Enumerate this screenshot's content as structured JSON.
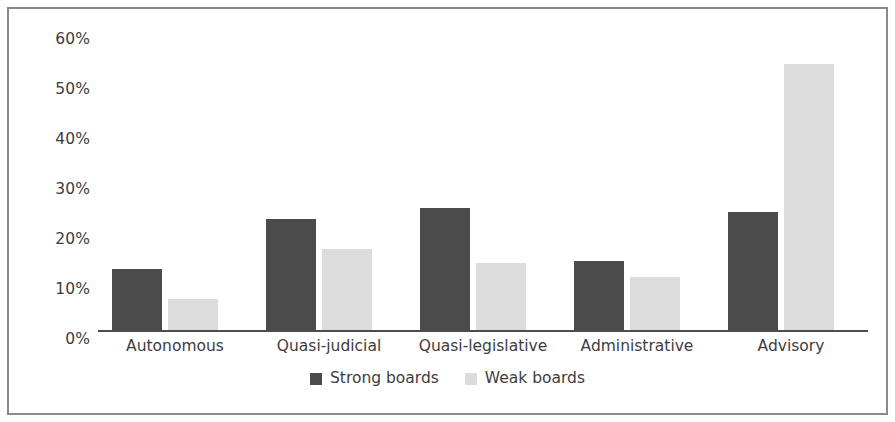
{
  "chart_data": {
    "type": "bar",
    "title": "",
    "subtitle": "",
    "xlabel": "",
    "ylabel": "",
    "categories": [
      "Autonomous",
      "Quasi-judicial",
      "Quasi-legislative",
      "Administrative",
      "Advisory"
    ],
    "series": [
      {
        "name": "Strong boards",
        "color": "#4b4b4b",
        "values": [
          12.2,
          22.3,
          24.5,
          13.8,
          23.7
        ]
      },
      {
        "name": "Weak boards",
        "color": "#dcdcdc",
        "values": [
          6.2,
          16.3,
          13.5,
          10.6,
          53.3
        ]
      }
    ],
    "ylim": [
      0,
      60
    ],
    "ytick_values": [
      60,
      50,
      40,
      30,
      20,
      10,
      0
    ],
    "ytick_labels": [
      "60%",
      "50%",
      "40%",
      "30%",
      "20%",
      "10%",
      "0%"
    ],
    "grid": false,
    "legend_position": "bottom-center",
    "annotations": [],
    "frame_border_color": "#8a8a8a",
    "axis_color": "#4c4c4c",
    "text_color": "#3d3d3d",
    "background_color": "#ffffff"
  },
  "legend": {
    "items": [
      {
        "label": "Strong boards",
        "swatch": "strong-boards-swatch"
      },
      {
        "label": "Weak boards",
        "swatch": "weak-boards-swatch"
      }
    ]
  }
}
